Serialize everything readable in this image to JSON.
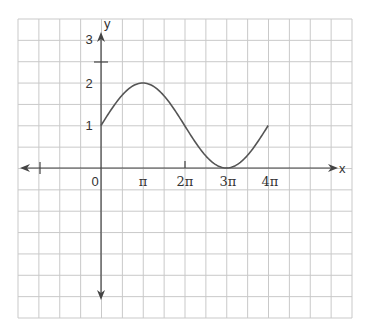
{
  "chart_data": {
    "type": "line",
    "title": "",
    "function": "y = 1 + sin(x/2)",
    "xlabel": "x",
    "ylabel": "y",
    "x_tick_labels": [
      "0",
      "π",
      "2π",
      "3π",
      "4π"
    ],
    "y_tick_labels": [
      "1",
      "2",
      "3"
    ],
    "x_domain_plotted": [
      0,
      12.566
    ],
    "points": [
      {
        "x_label": "0",
        "y": 1
      },
      {
        "x_label": "π",
        "y": 2
      },
      {
        "x_label": "2π",
        "y": 1
      },
      {
        "x_label": "3π",
        "y": 0
      },
      {
        "x_label": "4π",
        "y": 1
      }
    ],
    "grid": true,
    "axes_arrows": true
  },
  "labels": {
    "x_axis": "x",
    "y_axis": "y",
    "origin": "0",
    "pi": "π",
    "two_pi": "2π",
    "three_pi": "3π",
    "four_pi": "4π",
    "y1": "1",
    "y2": "2",
    "y3": "3"
  }
}
